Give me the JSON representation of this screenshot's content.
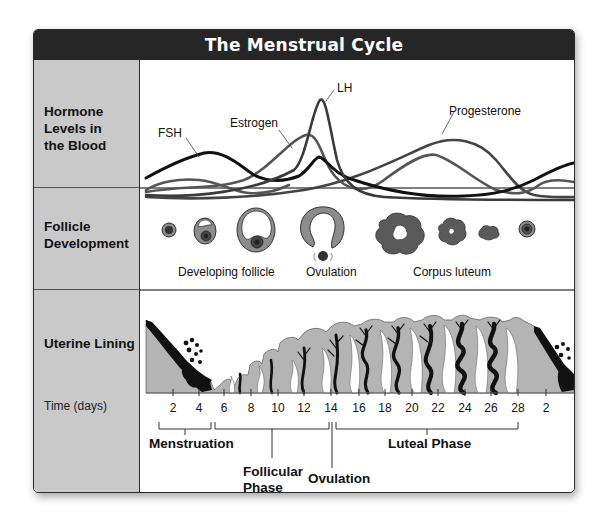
{
  "title": "The Menstrual Cycle",
  "rows": {
    "hormones": {
      "label_lines": [
        "Hormone",
        "Levels in",
        "the Blood"
      ],
      "curves": [
        {
          "name": "FSH",
          "color": "#111111"
        },
        {
          "name": "Estrogen",
          "color": "#555555"
        },
        {
          "name": "LH",
          "color": "#3a3a3a"
        },
        {
          "name": "Progesterone",
          "color": "#444444"
        }
      ],
      "labels": {
        "fsh": "FSH",
        "estrogen": "Estrogen",
        "lh": "LH",
        "progesterone": "Progesterone"
      }
    },
    "follicle": {
      "label_lines": [
        "Follicle",
        "Development"
      ],
      "captions": {
        "developing": "Developing follicle",
        "ovulation": "Ovulation",
        "corpus": "Corpus luteum"
      }
    },
    "uterine": {
      "label": "Uterine Lining",
      "time_label": "Time (days)",
      "days": [
        "2",
        "4",
        "6",
        "8",
        "10",
        "12",
        "14",
        "16",
        "18",
        "20",
        "22",
        "24",
        "26",
        "28",
        "2"
      ],
      "phases": {
        "menstruation": "Menstruation",
        "follicular_1": "Follicular",
        "follicular_2": "Phase",
        "ovulation": "Ovulation",
        "luteal": "Luteal Phase"
      }
    }
  },
  "colors": {
    "title_bg": "#262626",
    "label_col_bg": "#c9c9c9",
    "tissue": "#b4b4b4",
    "vessel": "#111111",
    "follicle_fill": "#8c8c8c",
    "corpus_fill": "#5a5a5a"
  }
}
